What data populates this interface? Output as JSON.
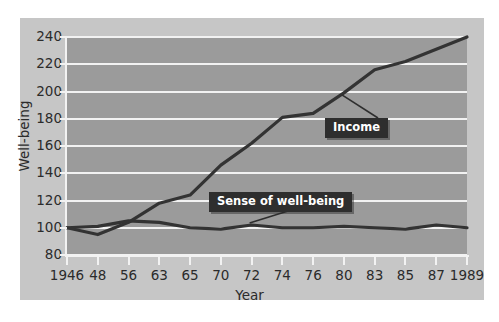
{
  "chart_data": {
    "type": "line",
    "title": "",
    "xlabel": "Year",
    "ylabel": "Well-being",
    "grid": true,
    "legend_position": "inline-callout",
    "xlim": [
      1946,
      1989
    ],
    "ylim": [
      80,
      240
    ],
    "yticks": [
      240,
      220,
      200,
      180,
      160,
      140,
      120,
      100,
      80
    ],
    "xticks": [
      "1946",
      "48",
      "56",
      "63",
      "65",
      "70",
      "72",
      "74",
      "76",
      "80",
      "83",
      "85",
      "87",
      "1989"
    ],
    "x": [
      1946,
      1948,
      1956,
      1963,
      1965,
      1970,
      1972,
      1974,
      1976,
      1980,
      1983,
      1985,
      1987,
      1989
    ],
    "series": [
      {
        "name": "Income",
        "color": "#333333",
        "values": [
          100,
          95,
          104,
          118,
          124,
          146,
          162,
          181,
          184,
          199,
          216,
          222,
          231,
          240
        ]
      },
      {
        "name": "Sense of well-being",
        "color": "#333333",
        "values": [
          100,
          101,
          105,
          104,
          100,
          99,
          102,
          100,
          100,
          101,
          100,
          99,
          102,
          100
        ]
      }
    ],
    "annotations": [
      {
        "text": "Income",
        "series": "Income"
      },
      {
        "text": "Sense of well-being",
        "series": "Sense of well-being"
      }
    ],
    "colors": {
      "plot_background": "#9b9b9b",
      "panel_background": "#c6c6c6",
      "gridline": "#f2f2f2",
      "line": "#333333",
      "callout_background": "#2e2e2e",
      "callout_text": "#ffffff",
      "tick_text": "#2b2b2b"
    }
  }
}
